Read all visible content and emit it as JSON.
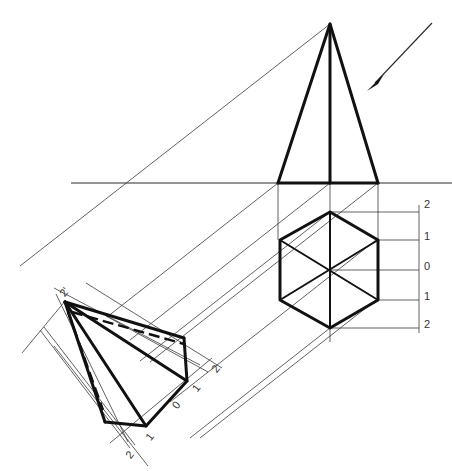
{
  "diagram": {
    "front_view": {
      "name": "elevation-triangle"
    },
    "top_view": {
      "name": "hexagon-plan",
      "depth_labels": [
        "2",
        "1",
        "0",
        "1",
        "2"
      ]
    },
    "auxiliary_view": {
      "apex_label": "2'",
      "depth_labels": [
        "2",
        "1",
        "0",
        "1",
        "2"
      ]
    },
    "arrow": {
      "name": "line-of-sight-arrow"
    }
  }
}
